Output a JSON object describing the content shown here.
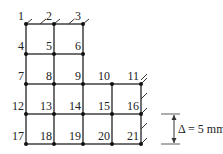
{
  "diagram": {
    "title": "",
    "line_color": "#333333",
    "node_color": "#111111",
    "nodes": [
      {
        "id": "1",
        "x": 26,
        "y": 24
      },
      {
        "id": "2",
        "x": 54,
        "y": 24
      },
      {
        "id": "3",
        "x": 83,
        "y": 24
      },
      {
        "id": "4",
        "x": 26,
        "y": 54
      },
      {
        "id": "5",
        "x": 54,
        "y": 54
      },
      {
        "id": "6",
        "x": 83,
        "y": 54
      },
      {
        "id": "7",
        "x": 26,
        "y": 84
      },
      {
        "id": "8",
        "x": 54,
        "y": 84
      },
      {
        "id": "9",
        "x": 83,
        "y": 84
      },
      {
        "id": "10",
        "x": 112,
        "y": 84
      },
      {
        "id": "11",
        "x": 141,
        "y": 84
      },
      {
        "id": "12",
        "x": 26,
        "y": 114
      },
      {
        "id": "13",
        "x": 54,
        "y": 114
      },
      {
        "id": "14",
        "x": 83,
        "y": 114
      },
      {
        "id": "15",
        "x": 112,
        "y": 114
      },
      {
        "id": "16",
        "x": 141,
        "y": 114
      },
      {
        "id": "17",
        "x": 26,
        "y": 144
      },
      {
        "id": "18",
        "x": 54,
        "y": 144
      },
      {
        "id": "19",
        "x": 83,
        "y": 144
      },
      {
        "id": "20",
        "x": 112,
        "y": 144
      },
      {
        "id": "21",
        "x": 141,
        "y": 144
      }
    ],
    "supports": {
      "top": [
        "1",
        "2",
        "3"
      ],
      "right": [
        "11",
        "16",
        "21"
      ]
    },
    "displacement_label": "Δ = 5 mm",
    "displacement_from_node": "16",
    "displacement_to_node": "21"
  }
}
